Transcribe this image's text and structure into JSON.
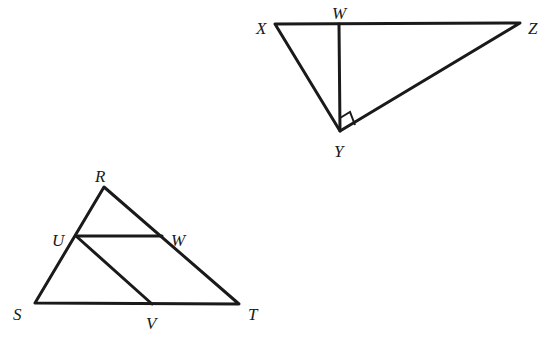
{
  "figure_top": {
    "name": "right triangle XYZ with altitude YW",
    "labels": {
      "X": "X",
      "W": "W",
      "Z": "Z",
      "Y": "Y"
    },
    "right_angle_at": "Y"
  },
  "figure_bottom": {
    "name": "triangle RST with segments UW and UV",
    "labels": {
      "R": "R",
      "U": "U",
      "W": "W",
      "S": "S",
      "V": "V",
      "T": "T"
    }
  },
  "colors": {
    "stroke": "#1a1a1a",
    "background": "#ffffff"
  }
}
